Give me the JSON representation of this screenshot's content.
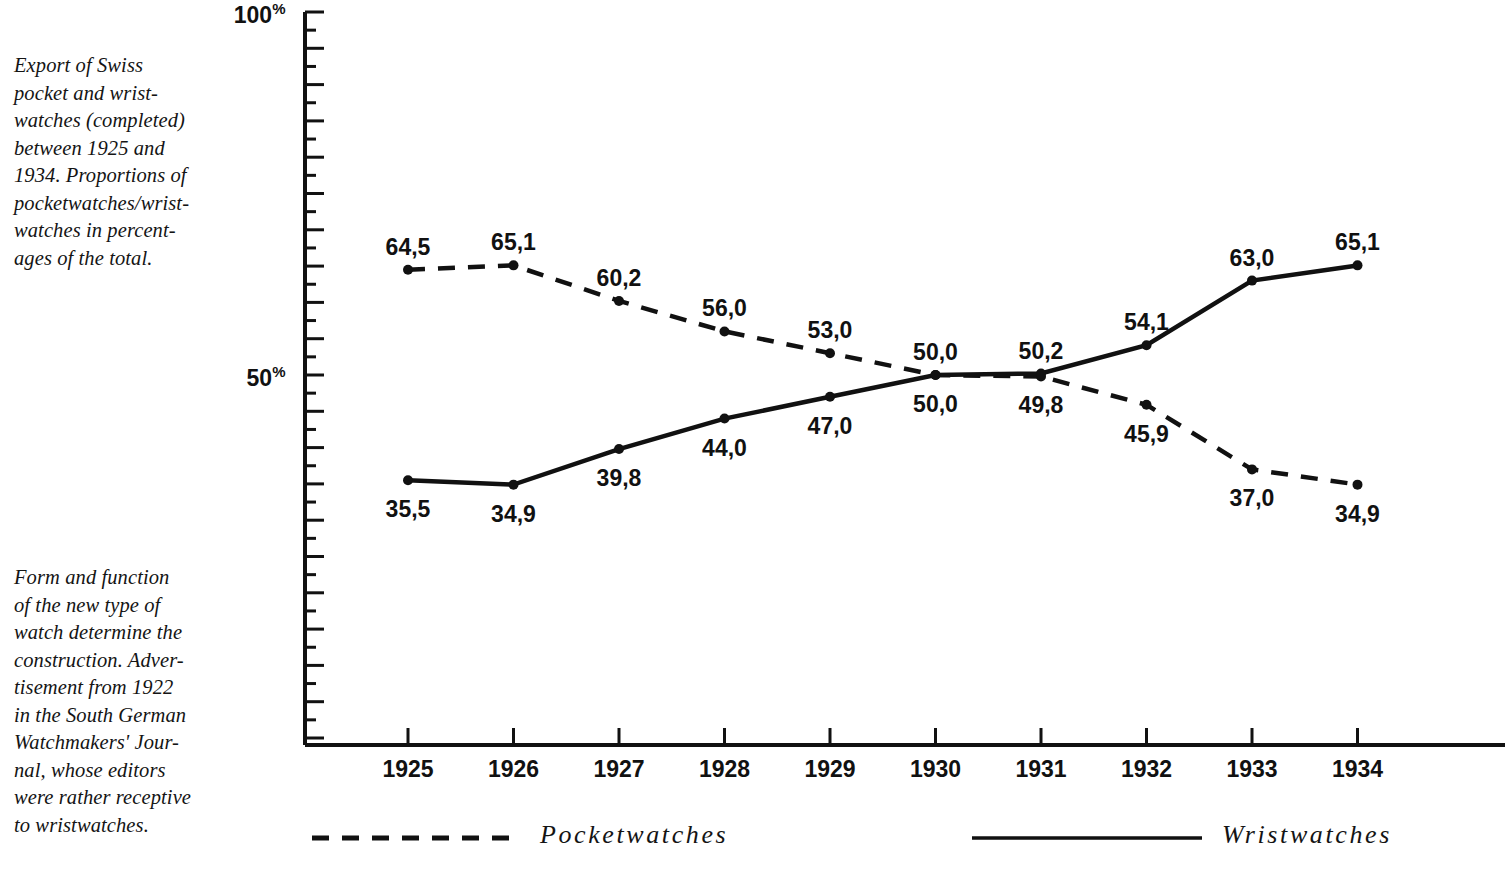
{
  "captions": {
    "top": {
      "name": "figure-caption-top",
      "lines": [
        "Export of Swiss",
        "pocket and wrist-",
        "watches (completed)",
        "between 1925 and",
        "1934. Proportions of",
        "pocketwatches/wrist-",
        "watches in percent-",
        "ages of the total."
      ]
    },
    "bottom": {
      "name": "figure-caption-bottom",
      "lines": [
        "Form and function",
        "of the new type of",
        "watch determine the",
        "construction. Adver-",
        "tisement from 1922",
        "in the South German",
        "Watchmakers' Jour-",
        "nal, whose editors",
        "were rather receptive",
        "to wristwatches."
      ]
    }
  },
  "legend": {
    "pocketwatches": "Pocketwatches",
    "wristwatches": "Wristwatches"
  },
  "axis": {
    "y_top_label": "100",
    "y_mid_label": "50",
    "percent_symbol": "%"
  },
  "chart_data": {
    "type": "line",
    "title": "",
    "xlabel": "",
    "ylabel": "",
    "ylim": [
      0,
      100
    ],
    "grid": false,
    "legend_position": "bottom",
    "y_tick_labels": [
      "100%",
      "50%"
    ],
    "y_tick_values": [
      100,
      50
    ],
    "categories": [
      "1925",
      "1926",
      "1927",
      "1928",
      "1929",
      "1930",
      "1931",
      "1932",
      "1933",
      "1934"
    ],
    "x": [
      1925,
      1926,
      1927,
      1928,
      1929,
      1930,
      1931,
      1932,
      1933,
      1934
    ],
    "series": [
      {
        "name": "Pocketwatches",
        "style": "dashed",
        "values": [
          64.5,
          65.1,
          60.2,
          56.0,
          53.0,
          50.0,
          49.8,
          45.9,
          37.0,
          34.9
        ],
        "labels": [
          "64,5",
          "65,1",
          "60,2",
          "56,0",
          "53,0",
          "50,0",
          "49,8",
          "45,9",
          "37,0",
          "34,9"
        ],
        "label_positions": [
          "above",
          "above",
          "above",
          "above",
          "above",
          "above",
          "below",
          "below",
          "below",
          "below"
        ]
      },
      {
        "name": "Wristwatches",
        "style": "solid",
        "values": [
          35.5,
          34.9,
          39.8,
          44.0,
          47.0,
          50.0,
          50.2,
          54.1,
          63.0,
          65.1
        ],
        "labels": [
          "35,5",
          "34,9",
          "39,8",
          "44,0",
          "47,0",
          "50,0",
          "50,2",
          "54,1",
          "63,0",
          "65,1"
        ],
        "label_positions": [
          "below",
          "below",
          "below",
          "below",
          "below",
          "below",
          "above",
          "above",
          "above",
          "above"
        ]
      }
    ]
  }
}
